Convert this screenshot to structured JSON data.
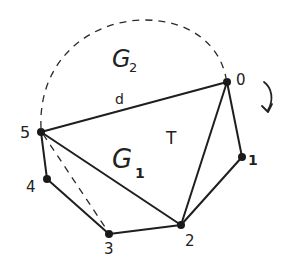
{
  "diagram": {
    "type": "polygon-triangulation",
    "nodes": [
      {
        "id": "0",
        "label": "0",
        "x": 227,
        "y": 82,
        "lx": 244,
        "ly": 79
      },
      {
        "id": "1",
        "label": "1",
        "x": 242,
        "y": 157,
        "lx": 252,
        "ly": 164
      },
      {
        "id": "2",
        "label": "2",
        "x": 181,
        "y": 225,
        "lx": 190,
        "ly": 245
      },
      {
        "id": "3",
        "label": "3",
        "x": 109,
        "y": 234,
        "lx": 111,
        "ly": 254
      },
      {
        "id": "4",
        "label": "4",
        "x": 47,
        "y": 179,
        "lx": 32,
        "ly": 192
      },
      {
        "id": "5",
        "label": "5",
        "x": 41,
        "y": 132,
        "lx": 24,
        "ly": 138
      }
    ],
    "edges": [
      {
        "from": "5",
        "to": "0",
        "style": "solid",
        "label": "d"
      },
      {
        "from": "0",
        "to": "1",
        "style": "solid"
      },
      {
        "from": "1",
        "to": "2",
        "style": "solid"
      },
      {
        "from": "2",
        "to": "3",
        "style": "solid"
      },
      {
        "from": "3",
        "to": "4",
        "style": "solid"
      },
      {
        "from": "4",
        "to": "5",
        "style": "solid"
      },
      {
        "from": "5",
        "to": "2",
        "style": "solid"
      },
      {
        "from": "0",
        "to": "2",
        "style": "solid"
      },
      {
        "from": "5",
        "to": "3",
        "style": "dashed"
      }
    ],
    "arc": {
      "from": "5",
      "to": "0",
      "style": "dashed",
      "label": "G2"
    },
    "region_labels": {
      "g2": {
        "main": "G",
        "sub": "2"
      },
      "g1": {
        "main": "G",
        "sub": "1"
      },
      "t": "T",
      "d": "d"
    },
    "rotation_arrow": {
      "direction": "clockwise"
    }
  }
}
